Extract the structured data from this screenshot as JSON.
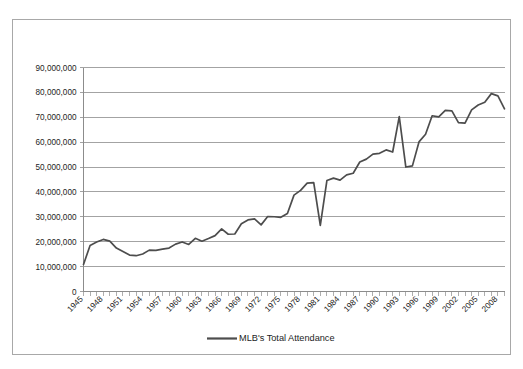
{
  "chart_data": {
    "type": "line",
    "title": "",
    "xlabel": "",
    "ylabel": "",
    "grid": true,
    "legend_position": "bottom",
    "ylim": [
      0,
      90000000
    ],
    "ytick_labels": [
      "0",
      "10,000,000",
      "20,000,000",
      "30,000,000",
      "40,000,000",
      "50,000,000",
      "60,000,000",
      "70,000,000",
      "80,000,000",
      "90,000,000"
    ],
    "ytick_values": [
      0,
      10000000,
      20000000,
      30000000,
      40000000,
      50000000,
      60000000,
      70000000,
      80000000,
      90000000
    ],
    "xlim": [
      1945,
      2009
    ],
    "xtick_labels": [
      "1945",
      "1948",
      "1951",
      "1954",
      "1957",
      "1960",
      "1963",
      "1966",
      "1969",
      "1972",
      "1975",
      "1978",
      "1981",
      "1984",
      "1987",
      "1990",
      "1993",
      "1996",
      "1999",
      "2002",
      "2005",
      "2008"
    ],
    "xtick_values": [
      1945,
      1948,
      1951,
      1954,
      1957,
      1960,
      1963,
      1966,
      1969,
      1972,
      1975,
      1978,
      1981,
      1984,
      1987,
      1990,
      1993,
      1996,
      1999,
      2002,
      2005,
      2008
    ],
    "x": [
      1945,
      1946,
      1947,
      1948,
      1949,
      1950,
      1951,
      1952,
      1953,
      1954,
      1955,
      1956,
      1957,
      1958,
      1959,
      1960,
      1961,
      1962,
      1963,
      1964,
      1965,
      1966,
      1967,
      1968,
      1969,
      1970,
      1971,
      1972,
      1973,
      1974,
      1975,
      1976,
      1977,
      1978,
      1979,
      1980,
      1981,
      1982,
      1983,
      1984,
      1985,
      1986,
      1987,
      1988,
      1989,
      1990,
      1991,
      1992,
      1993,
      1994,
      1995,
      1996,
      1997,
      1998,
      1999,
      2000,
      2001,
      2002,
      2003,
      2004,
      2005,
      2006,
      2007,
      2008,
      2009
    ],
    "series": [
      {
        "name": "MLB's Total Attendance",
        "color": "#4d4d4d",
        "values": [
          10840000,
          18520000,
          19870000,
          20920000,
          20220000,
          17460000,
          16040000,
          14640000,
          14380000,
          15080000,
          16620000,
          16540000,
          17010000,
          17460000,
          19030000,
          19910000,
          18900000,
          21380000,
          20200000,
          21280000,
          22440000,
          25180000,
          23000000,
          23100000,
          27230000,
          28750000,
          29190000,
          26780000,
          30110000,
          30030000,
          29790000,
          31320000,
          38720000,
          40640000,
          43550000,
          43750000,
          26520000,
          44590000,
          45540000,
          44740000,
          46840000,
          47500000,
          52010000,
          53180000,
          55170000,
          55520000,
          56890000,
          56040000,
          70260000,
          50010000,
          50470000,
          60100000,
          63200000,
          70600000,
          70140000,
          72750000,
          72600000,
          67860000,
          67630000,
          72970000,
          74920000,
          76040000,
          79500000,
          78620000,
          73420000
        ]
      }
    ]
  },
  "legend": {
    "items": [
      {
        "label": "MLB's Total Attendance",
        "color": "#4d4d4d"
      }
    ]
  }
}
